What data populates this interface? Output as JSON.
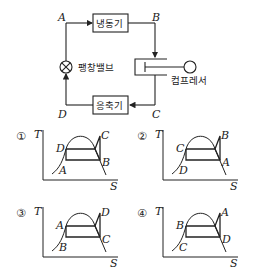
{
  "cycle_diagram": {
    "points": {
      "A": "A",
      "B": "B",
      "C": "C",
      "D": "D"
    },
    "evaporator_label": "냉동기",
    "condenser_label": "응축기",
    "expansion_valve_label": "팽창밸브",
    "compressor_label": "컴프레서"
  },
  "options": [
    {
      "number": "①",
      "y_axis": "T",
      "x_axis": "S",
      "top_right": "C",
      "left_top": "D",
      "bottom_left": "A",
      "bottom_right": "B"
    },
    {
      "number": "②",
      "y_axis": "T",
      "x_axis": "S",
      "top_right": "B",
      "left_top": "C",
      "bottom_left": "D",
      "bottom_right": "A"
    },
    {
      "number": "③",
      "y_axis": "T",
      "x_axis": "S",
      "top_right": "D",
      "left_top": "A",
      "bottom_left": "B",
      "bottom_right": "C"
    },
    {
      "number": "④",
      "y_axis": "T",
      "x_axis": "S",
      "top_right": "A",
      "left_top": "B",
      "bottom_left": "C",
      "bottom_right": "D"
    }
  ],
  "colors": {
    "line": "#222222",
    "background": "#ffffff"
  }
}
